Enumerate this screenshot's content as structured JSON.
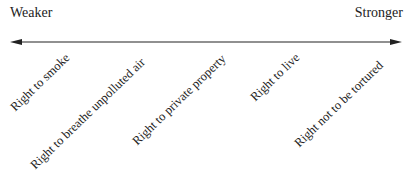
{
  "diagram": {
    "type": "spectrum",
    "left_label": "Weaker",
    "right_label": "Stronger",
    "arrow": "bidirectional",
    "items": [
      {
        "label": "Right to smoke",
        "x": 17,
        "y": 101
      },
      {
        "label": "Right to breathe unpolluted air",
        "x": 37,
        "y": 159
      },
      {
        "label": "Right to private property",
        "x": 139,
        "y": 135
      },
      {
        "label": "Right to live",
        "x": 257,
        "y": 91
      },
      {
        "label": "Right not to be tortured",
        "x": 301,
        "y": 137
      }
    ]
  }
}
